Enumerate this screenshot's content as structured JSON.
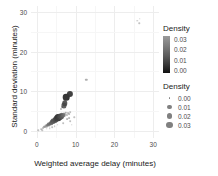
{
  "chart_data": {
    "type": "scatter",
    "title": "",
    "xlabel": "Weighted average delay (minutes)",
    "ylabel": "Standard deviation (minutes)",
    "xlim": [
      -1.5,
      31.5
    ],
    "ylim": [
      -1.8,
      31.5
    ],
    "xticks": [
      0,
      10,
      20,
      30
    ],
    "yticks": [
      0,
      10,
      20,
      30
    ],
    "xticklabels": [
      "0",
      "10",
      "20",
      "30"
    ],
    "yticklabels": [
      "0",
      "10",
      "20",
      "30"
    ],
    "grid": true,
    "legend_position": "right",
    "legends": [
      {
        "kind": "colorbar",
        "title": "Density",
        "labels": [
          "0.03",
          "0.02",
          "0.01",
          "0.00"
        ],
        "values": [
          0.03,
          0.02,
          0.01,
          0.0
        ],
        "low_color": "#111111",
        "high_color": "#9a9a9a"
      },
      {
        "kind": "size",
        "title": "Density",
        "labels": [
          "0.00",
          "0.01",
          "0.02",
          "0.03"
        ],
        "values": [
          0.0,
          0.01,
          0.02,
          0.03
        ],
        "dot_sizes_px": [
          1.6,
          4.2,
          5.6,
          6.8
        ],
        "dot_color": "#808080"
      }
    ],
    "encoding": {
      "x": "Weighted average delay (minutes)",
      "y": "Standard deviation (minutes)",
      "size": "Density",
      "color": "Density"
    },
    "points": [
      {
        "x": 0.35,
        "y": 0.15,
        "d": 0.001
      },
      {
        "x": 1.15,
        "y": 0.45,
        "d": 0.002
      },
      {
        "x": 1.55,
        "y": 0.75,
        "d": 0.004
      },
      {
        "x": 1.9,
        "y": 1.05,
        "d": 0.006
      },
      {
        "x": 2.1,
        "y": 0.9,
        "d": 0.005
      },
      {
        "x": 2.35,
        "y": 1.35,
        "d": 0.009
      },
      {
        "x": 2.55,
        "y": 1.15,
        "d": 0.007
      },
      {
        "x": 2.8,
        "y": 1.6,
        "d": 0.012
      },
      {
        "x": 3.0,
        "y": 1.45,
        "d": 0.01
      },
      {
        "x": 3.2,
        "y": 1.85,
        "d": 0.014
      },
      {
        "x": 3.45,
        "y": 1.7,
        "d": 0.011
      },
      {
        "x": 3.6,
        "y": 2.1,
        "d": 0.016
      },
      {
        "x": 3.8,
        "y": 1.95,
        "d": 0.013
      },
      {
        "x": 3.95,
        "y": 2.35,
        "d": 0.018
      },
      {
        "x": 4.15,
        "y": 2.15,
        "d": 0.015
      },
      {
        "x": 4.3,
        "y": 2.6,
        "d": 0.02
      },
      {
        "x": 4.45,
        "y": 2.4,
        "d": 0.017
      },
      {
        "x": 4.6,
        "y": 2.85,
        "d": 0.022
      },
      {
        "x": 4.75,
        "y": 2.6,
        "d": 0.019
      },
      {
        "x": 4.9,
        "y": 3.05,
        "d": 0.024
      },
      {
        "x": 5.05,
        "y": 2.8,
        "d": 0.021
      },
      {
        "x": 5.2,
        "y": 3.25,
        "d": 0.026
      },
      {
        "x": 5.35,
        "y": 3.0,
        "d": 0.023
      },
      {
        "x": 5.5,
        "y": 3.45,
        "d": 0.028
      },
      {
        "x": 5.65,
        "y": 3.2,
        "d": 0.025
      },
      {
        "x": 5.8,
        "y": 3.6,
        "d": 0.027
      },
      {
        "x": 5.95,
        "y": 3.35,
        "d": 0.024
      },
      {
        "x": 6.1,
        "y": 3.8,
        "d": 0.022
      },
      {
        "x": 6.25,
        "y": 3.5,
        "d": 0.02
      },
      {
        "x": 6.4,
        "y": 3.95,
        "d": 0.018
      },
      {
        "x": 6.55,
        "y": 3.6,
        "d": 0.016
      },
      {
        "x": 6.7,
        "y": 4.1,
        "d": 0.014
      },
      {
        "x": 6.85,
        "y": 3.75,
        "d": 0.012
      },
      {
        "x": 7.0,
        "y": 4.3,
        "d": 0.01
      },
      {
        "x": 7.2,
        "y": 3.9,
        "d": 0.008
      },
      {
        "x": 7.45,
        "y": 4.5,
        "d": 0.006
      },
      {
        "x": 7.7,
        "y": 4.1,
        "d": 0.005
      },
      {
        "x": 8.0,
        "y": 4.6,
        "d": 0.004
      },
      {
        "x": 8.3,
        "y": 4.25,
        "d": 0.003
      },
      {
        "x": 8.6,
        "y": 4.75,
        "d": 0.002
      },
      {
        "x": 6.3,
        "y": 5.5,
        "d": 0.004
      },
      {
        "x": 6.6,
        "y": 5.9,
        "d": 0.003
      },
      {
        "x": 7.0,
        "y": 6.4,
        "d": 0.022
      },
      {
        "x": 7.2,
        "y": 7.0,
        "d": 0.024
      },
      {
        "x": 7.6,
        "y": 8.5,
        "d": 0.03
      },
      {
        "x": 8.5,
        "y": 9.4,
        "d": 0.028
      },
      {
        "x": 12.8,
        "y": 12.9,
        "d": 0.006
      },
      {
        "x": 4.0,
        "y": 0.9,
        "d": 0.002
      },
      {
        "x": 4.6,
        "y": 1.25,
        "d": 0.002
      },
      {
        "x": 5.4,
        "y": 1.55,
        "d": 0.002
      },
      {
        "x": 6.8,
        "y": 2.0,
        "d": 0.002
      },
      {
        "x": 8.6,
        "y": 2.5,
        "d": 0.002
      },
      {
        "x": 9.0,
        "y": 1.6,
        "d": 0.001
      },
      {
        "x": 7.9,
        "y": 3.0,
        "d": 0.003
      },
      {
        "x": 8.3,
        "y": 3.3,
        "d": 0.003
      },
      {
        "x": 25.9,
        "y": 27.8,
        "d": 0.001
      },
      {
        "x": 26.4,
        "y": 27.1,
        "d": 0.001
      },
      {
        "x": 26.6,
        "y": 28.3,
        "d": 0.001
      },
      {
        "x": 1.4,
        "y": 0.2,
        "d": 0.001
      },
      {
        "x": 2.6,
        "y": 0.5,
        "d": 0.001
      },
      {
        "x": 3.3,
        "y": 0.65,
        "d": 0.001
      },
      {
        "x": 9.6,
        "y": 3.4,
        "d": 0.001
      }
    ]
  },
  "axes": {
    "x_title": "Weighted average delay (minutes)",
    "y_title": "Standard deviation (minutes)"
  }
}
